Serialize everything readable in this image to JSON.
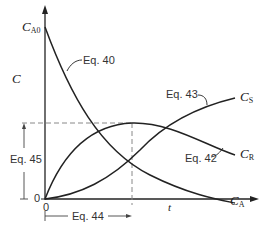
{
  "diagram": {
    "type": "concentration-time curves for reactions in series A → R → S",
    "axes": {
      "y_label": "C",
      "x_label": "t",
      "y_origin_label": "0",
      "x_origin_label": "0",
      "y_initial_label": {
        "main": "C",
        "sub": "A0"
      }
    },
    "curves": [
      {
        "name": "C_A",
        "label_main": "C",
        "label_sub": "A",
        "equation": "Eq. 40",
        "shape": "exponential decay from C_A0"
      },
      {
        "name": "C_R",
        "label_main": "C",
        "label_sub": "R",
        "equation": "Eq. 42",
        "shape": "rises to maximum then decays"
      },
      {
        "name": "C_S",
        "label_main": "C",
        "label_sub": "S",
        "equation": "Eq. 43",
        "shape": "S-shaped rise from zero"
      }
    ],
    "annotations": {
      "max_conc": "Eq. 45",
      "time_at_max": "Eq. 44"
    },
    "colors": {
      "line": "#222222",
      "dashed": "#888888",
      "text": "#333333"
    }
  }
}
